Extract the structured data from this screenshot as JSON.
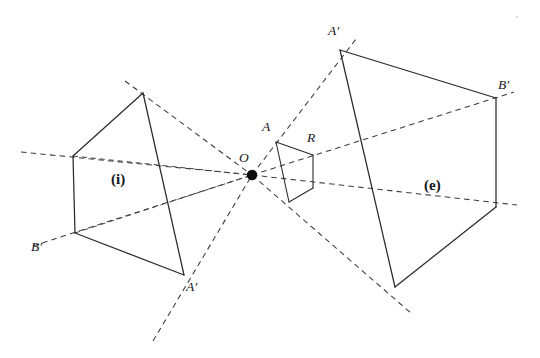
{
  "figure": {
    "width": 540,
    "height": 358,
    "background": "#ffffff",
    "stroke_solid": "#2a2a2f",
    "stroke_dashed": "#3a3a42"
  },
  "labels": {
    "center": {
      "text": "O",
      "x": 239,
      "y": 151
    },
    "ref_a": {
      "text": "A",
      "x": 262,
      "y": 120
    },
    "ref_r": {
      "text": "R",
      "x": 307,
      "y": 132
    },
    "interior_region": {
      "text": "(i)",
      "x": 111,
      "y": 172
    },
    "exterior_region": {
      "text": "(e)",
      "x": 424,
      "y": 178
    },
    "interior_a_prime": {
      "text": "A′",
      "x": 186,
      "y": 280
    },
    "interior_b_prime": {
      "text": "B′",
      "x": 31,
      "y": 241
    },
    "exterior_a_prime": {
      "text": "A′",
      "x": 328,
      "y": 24
    },
    "exterior_b_prime": {
      "text": "B′",
      "x": 498,
      "y": 78
    }
  },
  "geometry": {
    "center_point": {
      "x": 252,
      "y": 175,
      "radius": 5.2
    },
    "reference_quad": {
      "name": "R",
      "vertices": [
        {
          "name": "A",
          "x": 276,
          "y": 142
        },
        {
          "name": "R",
          "x": 313,
          "y": 155
        },
        {
          "name": "S",
          "x": 313,
          "y": 188
        },
        {
          "name": "T",
          "x": 289,
          "y": 202
        }
      ]
    },
    "interior_image": {
      "name": "(i)",
      "vertices": [
        {
          "name": "apex",
          "x": 143,
          "y": 93
        },
        {
          "name": "left-upper",
          "x": 73,
          "y": 156
        },
        {
          "name": "B-prime",
          "x": 75,
          "y": 233
        },
        {
          "name": "A-prime",
          "x": 184,
          "y": 275
        }
      ]
    },
    "exterior_image": {
      "name": "(e)",
      "vertices": [
        {
          "name": "A-prime",
          "x": 340,
          "y": 50
        },
        {
          "name": "B-prime",
          "x": 496,
          "y": 98
        },
        {
          "name": "right-lower",
          "x": 496,
          "y": 207
        },
        {
          "name": "bottom",
          "x": 395,
          "y": 287
        }
      ]
    },
    "rays": [
      {
        "name": "ray-apex",
        "x1": 124,
        "y1": 81,
        "x2": 355,
        "y2": 40
      },
      {
        "name": "ray-left-upper",
        "x1": 21,
        "y1": 152,
        "x2": 512,
        "y2": 92
      },
      {
        "name": "ray-b-prime",
        "x1": 34,
        "y1": 245,
        "x2": 516,
        "y2": 204
      },
      {
        "name": "ray-a-prime",
        "x1": 154,
        "y1": 341,
        "x2": 410,
        "y2": 312
      }
    ]
  }
}
